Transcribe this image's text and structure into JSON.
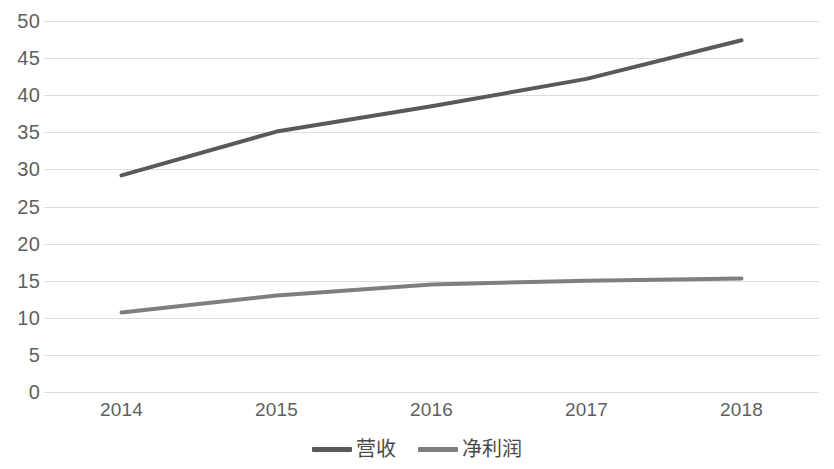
{
  "chart_data": {
    "type": "line",
    "title": "",
    "xlabel": "",
    "ylabel": "",
    "categories": [
      "2014",
      "2015",
      "2016",
      "2017",
      "2018"
    ],
    "series": [
      {
        "name": "营收",
        "values": [
          29.2,
          35.1,
          38.5,
          42.2,
          47.4
        ],
        "color": "#595959"
      },
      {
        "name": "净利润",
        "values": [
          10.7,
          13.0,
          14.5,
          15.0,
          15.3
        ],
        "color": "#7f7f7f"
      }
    ],
    "ylim": [
      0,
      50
    ],
    "yticks": [
      0,
      5,
      10,
      15,
      20,
      25,
      30,
      35,
      40,
      45,
      50
    ],
    "ytick_labels": [
      "0",
      "5",
      "10",
      "15",
      "20",
      "25",
      "30",
      "35",
      "40",
      "45",
      "50"
    ],
    "grid": true,
    "grid_color": "#dedede",
    "legend_position": "bottom",
    "background": "#ffffff"
  },
  "legend": {
    "items": [
      {
        "label": "营收",
        "color": "#595959"
      },
      {
        "label": "净利润",
        "color": "#7f7f7f"
      }
    ]
  }
}
